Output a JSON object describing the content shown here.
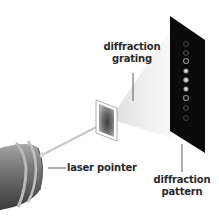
{
  "diagram": {
    "type": "physics-apparatus",
    "labels": {
      "grating_line1": "diffraction",
      "grating_line2": "grating",
      "laser": "laser pointer",
      "pattern_line1": "diffraction",
      "pattern_line2": "pattern"
    },
    "components": [
      {
        "id": "laser-pointer",
        "name": "laser pointer"
      },
      {
        "id": "diffraction-grating",
        "name": "diffraction grating"
      },
      {
        "id": "diffraction-pattern",
        "name": "diffraction pattern",
        "spots": 9
      }
    ],
    "colors": {
      "screen": "#0a0a0a",
      "beam": "#c8c8c8",
      "laser_body": "#6a6a6a",
      "text": "#2a2a2a"
    }
  }
}
